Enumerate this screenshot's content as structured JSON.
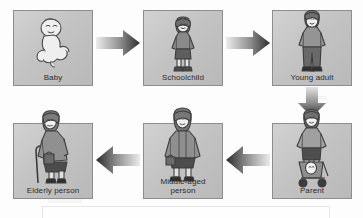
{
  "diagram": {
    "background_color": "#fdfdfd",
    "box_fill_color": "#c6c6c6",
    "box_border_color": "#8d8d8d",
    "label_color": "#2b2b2b",
    "arrow_dark_color": "#2e2e2e",
    "arrow_light_color": "#e8e8e8",
    "stages": [
      {
        "id": "baby",
        "label": "Baby",
        "icon": "baby-figure-icon",
        "row": "top",
        "position": 1
      },
      {
        "id": "schoolchild",
        "label": "Schoolchild",
        "icon": "schoolchild-figure-icon",
        "row": "top",
        "position": 2
      },
      {
        "id": "young-adult",
        "label": "Young adult",
        "icon": "young-adult-figure-icon",
        "row": "top",
        "position": 3
      },
      {
        "id": "parent",
        "label": "Parent",
        "icon": "parent-with-pushchair-figure-icon",
        "row": "bottom",
        "position": 4
      },
      {
        "id": "middle-aged-person",
        "label": "Middle-aged\nperson",
        "icon": "middle-aged-person-figure-icon",
        "row": "bottom",
        "position": 5
      },
      {
        "id": "elderly-person",
        "label": "Elderly person",
        "icon": "elderly-person-with-walking-stick-figure-icon",
        "row": "bottom",
        "position": 6
      }
    ],
    "arrows": [
      {
        "id": "baby-to-schoolchild",
        "icon": "arrow-right-icon",
        "direction": "right",
        "from": "baby",
        "to": "schoolchild"
      },
      {
        "id": "schoolchild-to-young-adult",
        "icon": "arrow-right-icon",
        "direction": "right",
        "from": "schoolchild",
        "to": "young-adult"
      },
      {
        "id": "young-adult-to-parent",
        "icon": "arrow-down-icon",
        "direction": "down",
        "from": "young-adult",
        "to": "parent"
      },
      {
        "id": "parent-to-middle-aged",
        "icon": "arrow-left-icon",
        "direction": "left",
        "from": "parent",
        "to": "middle-aged-person"
      },
      {
        "id": "middle-aged-to-elderly",
        "icon": "arrow-left-icon",
        "direction": "left",
        "from": "middle-aged-person",
        "to": "elderly-person"
      }
    ],
    "bottom_frame": {
      "id": "empty-caption-frame",
      "label": ""
    }
  }
}
